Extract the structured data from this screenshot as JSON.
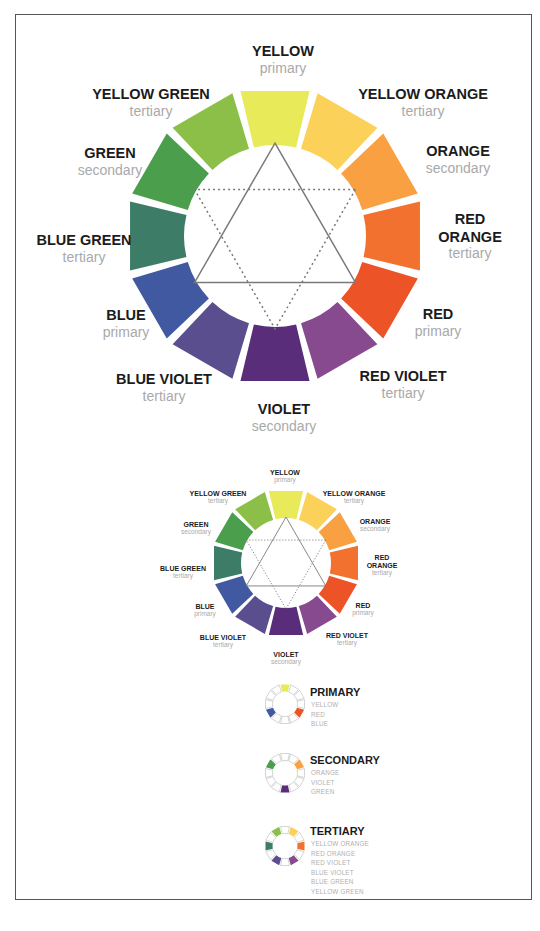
{
  "wheel": {
    "segments": [
      {
        "name": "YELLOW",
        "type": "primary",
        "color": "#e8ea5a"
      },
      {
        "name": "YELLOW ORANGE",
        "type": "tertiary",
        "color": "#fcd15a"
      },
      {
        "name": "ORANGE",
        "type": "secondary",
        "color": "#f9a142"
      },
      {
        "name": "RED ORANGE",
        "name_lines": [
          "RED",
          "ORANGE"
        ],
        "type": "tertiary",
        "color": "#f2712f"
      },
      {
        "name": "RED",
        "type": "primary",
        "color": "#ec5326"
      },
      {
        "name": "RED VIOLET",
        "type": "tertiary",
        "color": "#874a8e"
      },
      {
        "name": "VIOLET",
        "type": "secondary",
        "color": "#5a2d7a"
      },
      {
        "name": "BLUE VIOLET",
        "type": "tertiary",
        "color": "#5b4e8e"
      },
      {
        "name": "BLUE",
        "type": "primary",
        "color": "#4159a0"
      },
      {
        "name": "BLUE GREEN",
        "type": "tertiary",
        "color": "#3d7d67"
      },
      {
        "name": "GREEN",
        "type": "secondary",
        "color": "#4b9e4c"
      },
      {
        "name": "YELLOW GREEN",
        "type": "tertiary",
        "color": "#8cbf48"
      }
    ],
    "labels": {
      "yellow": {
        "name": "YELLOW",
        "type": "primary"
      },
      "yellow_orange": {
        "name": "YELLOW ORANGE",
        "type": "tertiary"
      },
      "orange": {
        "name": "ORANGE",
        "type": "secondary"
      },
      "red_orange_1": "RED",
      "red_orange_2": "ORANGE",
      "red_orange_type": "tertiary",
      "red": {
        "name": "RED",
        "type": "primary"
      },
      "red_violet": {
        "name": "RED VIOLET",
        "type": "tertiary"
      },
      "violet": {
        "name": "VIOLET",
        "type": "secondary"
      },
      "blue_violet": {
        "name": "BLUE VIOLET",
        "type": "tertiary"
      },
      "blue": {
        "name": "BLUE",
        "type": "primary"
      },
      "blue_green": {
        "name": "BLUE GREEN",
        "type": "tertiary"
      },
      "green": {
        "name": "GREEN",
        "type": "secondary"
      },
      "yellow_green": {
        "name": "YELLOW GREEN",
        "type": "tertiary"
      }
    },
    "triangles": {
      "primary": "solid",
      "secondary": "dotted"
    }
  },
  "keys": [
    {
      "title": "PRIMARY",
      "items": [
        "YELLOW",
        "RED",
        "BLUE"
      ],
      "highlight": [
        0,
        4,
        8
      ]
    },
    {
      "title": "SECONDARY",
      "items": [
        "ORANGE",
        "VIOLET",
        "GREEN"
      ],
      "highlight": [
        2,
        6,
        10
      ]
    },
    {
      "title": "TERTIARY",
      "items": [
        "YELLOW ORANGE",
        "RED ORANGE",
        "RED VIOLET",
        "BLUE VIOLET",
        "BLUE GREEN",
        "YELLOW GREEN"
      ],
      "highlight": [
        1,
        3,
        5,
        7,
        9,
        11
      ]
    }
  ]
}
